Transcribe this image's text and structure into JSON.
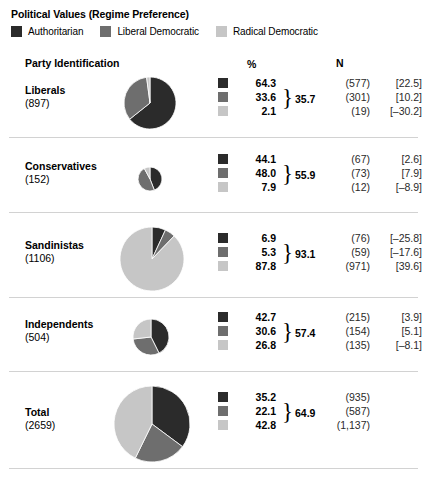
{
  "title": "Political Values (Regime Preference)",
  "legend": [
    {
      "label": "Authoritarian",
      "color": "#2b2b2b",
      "key": "authoritarian"
    },
    {
      "label": "Liberal Democratic",
      "color": "#6e6e6e",
      "key": "liberal_democratic"
    },
    {
      "label": "Radical Democratic",
      "color": "#c6c6c6",
      "key": "radical_democratic"
    }
  ],
  "columns": {
    "party": "Party Identification",
    "pct": "%",
    "n": "N"
  },
  "chart_data": {
    "type": "pie",
    "title": "Political Values (Regime Preference)",
    "categories": [
      "Authoritarian",
      "Liberal Democratic",
      "Radical Democratic"
    ],
    "colors": [
      "#2b2b2b",
      "#6e6e6e",
      "#c6c6c6"
    ],
    "legend_position": "top",
    "value_columns": [
      "%",
      "N",
      "bracket"
    ],
    "groups": [
      {
        "name": "Liberals",
        "count": "(897)",
        "n_total": 897,
        "pie_radius": 26,
        "values": [
          64.3,
          33.6,
          2.1
        ],
        "pct_labels": [
          "64.3",
          "33.6",
          "2.1"
        ],
        "n_labels": [
          "(577)",
          "(301)",
          "(19)"
        ],
        "bracket_labels": [
          "[22.5]",
          "[10.2]",
          "[‒30.2]"
        ],
        "brace_total": "35.7"
      },
      {
        "name": "Conservatives",
        "count": "(152)",
        "n_total": 152,
        "pie_radius": 12,
        "values": [
          44.1,
          48.0,
          7.9
        ],
        "pct_labels": [
          "44.1",
          "48.0",
          "7.9"
        ],
        "n_labels": [
          "(67)",
          "(73)",
          "(12)"
        ],
        "bracket_labels": [
          "[2.6]",
          "[7.9]",
          "[‒8.9]"
        ],
        "brace_total": "55.9"
      },
      {
        "name": "Sandinistas",
        "count": "(1106)",
        "n_total": 1106,
        "pie_radius": 32,
        "values": [
          6.9,
          5.3,
          87.8
        ],
        "pct_labels": [
          "6.9",
          "5.3",
          "87.8"
        ],
        "n_labels": [
          "(76)",
          "(59)",
          "(971)"
        ],
        "bracket_labels": [
          "[‒25.8]",
          "[‒17.6]",
          "[39.6]"
        ],
        "brace_total": "93.1"
      },
      {
        "name": "Independents",
        "count": "(504)",
        "n_total": 504,
        "pie_radius": 18,
        "values": [
          42.7,
          30.6,
          26.8
        ],
        "pct_labels": [
          "42.7",
          "30.6",
          "26.8"
        ],
        "n_labels": [
          "(215)",
          "(154)",
          "(135)"
        ],
        "bracket_labels": [
          "[3.9]",
          "[5.1]",
          "[‒8.1]"
        ],
        "brace_total": "57.4"
      },
      {
        "name": "Total",
        "count": "(2659)",
        "n_total": 2659,
        "pie_radius": 38,
        "values": [
          35.2,
          22.1,
          42.8
        ],
        "pct_labels": [
          "35.2",
          "22.1",
          "42.8"
        ],
        "n_labels": [
          "(935)",
          "(587)",
          "(1,137)"
        ],
        "bracket_labels": [
          "",
          "",
          ""
        ],
        "brace_total": "64.9"
      }
    ]
  },
  "layout": {
    "rows": [
      {
        "top": 70,
        "rule_y": 137,
        "pie_cx": 150,
        "pie_cy": 103,
        "label_y": 84,
        "vals_y": 76
      },
      {
        "top": 146,
        "rule_y": 212,
        "pie_cx": 150,
        "pie_cy": 179,
        "label_y": 160,
        "vals_y": 152
      },
      {
        "top": 221,
        "rule_y": 297,
        "pie_cx": 152,
        "pie_cy": 259,
        "label_y": 239,
        "vals_y": 231
      },
      {
        "top": 306,
        "rule_y": 371,
        "pie_cx": 151,
        "pie_cy": 337,
        "label_y": 318,
        "vals_y": 310
      },
      {
        "top": 380,
        "rule_y": 468,
        "pie_cx": 152,
        "pie_cy": 424,
        "label_y": 406,
        "vals_y": 390
      }
    ],
    "vals_left": 218,
    "brace_char": "}"
  }
}
